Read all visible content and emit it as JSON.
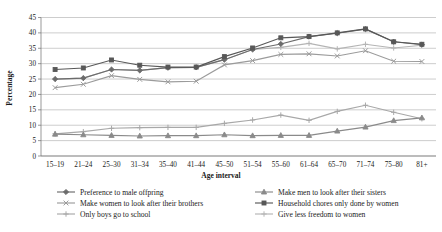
{
  "chart_data": {
    "type": "line",
    "title": "",
    "xlabel": "Age interval",
    "ylabel": "Percentage",
    "ylim": [
      0,
      45
    ],
    "yticks": [
      0,
      5,
      10,
      15,
      20,
      25,
      30,
      35,
      40,
      45
    ],
    "grid": true,
    "legend_position": "bottom",
    "categories": [
      "15–19",
      "21–24",
      "25–30",
      "31–34",
      "35–40",
      "41–44",
      "45–50",
      "51–54",
      "55–60",
      "61–64",
      "65–70",
      "71–74",
      "75–80",
      "81+"
    ],
    "series": [
      {
        "name": "Preference to male offpring",
        "marker": "diamond",
        "color": "#6b6b6b",
        "values": [
          25.0,
          25.3,
          28.1,
          27.8,
          28.7,
          28.8,
          31.3,
          34.6,
          36.4,
          38.8,
          39.9,
          41.2,
          37.1,
          36.2
        ]
      },
      {
        "name": "Make men to look after their sisters",
        "marker": "triangle",
        "color": "#8a8a8a",
        "values": [
          7.1,
          6.9,
          6.7,
          6.5,
          6.6,
          6.6,
          6.9,
          6.6,
          6.7,
          6.7,
          8.1,
          9.4,
          11.5,
          12.4
        ]
      },
      {
        "name": "Make women to look after their brothers",
        "marker": "cross",
        "color": "#9b9b9b",
        "values": [
          22.2,
          23.3,
          26.1,
          24.9,
          24.1,
          24.3,
          29.6,
          31.0,
          33.0,
          33.2,
          32.5,
          34.2,
          30.8,
          30.7
        ]
      },
      {
        "name": "Household chores only done by women",
        "marker": "square",
        "color": "#585858",
        "values": [
          28.1,
          28.6,
          31.2,
          29.5,
          28.9,
          28.9,
          32.3,
          35.1,
          38.4,
          38.8,
          40.0,
          41.3,
          37.1,
          36.3
        ]
      },
      {
        "name": "Only boys go to school",
        "marker": "plus",
        "color": "#a8a8a8",
        "values": [
          7.2,
          7.9,
          9.0,
          9.2,
          9.3,
          9.3,
          10.6,
          11.7,
          13.3,
          11.6,
          14.5,
          16.5,
          14.2,
          12.1
        ]
      },
      {
        "name": "Give less freedom to women",
        "marker": "plus-light",
        "color": "#b4b4b4",
        "values": [
          25.0,
          25.3,
          28.1,
          27.8,
          28.7,
          28.8,
          31.3,
          34.6,
          35.3,
          36.6,
          34.8,
          36.3,
          35.1,
          36.0
        ]
      }
    ]
  },
  "axes": {
    "y_title": "Percentage",
    "x_title": "Age interval"
  },
  "legend": {
    "column_left": [
      "Preference to male offpring",
      "Make women to look after their brothers",
      "Only boys go to school"
    ],
    "column_right": [
      "Make men to look after their sisters",
      "Household chores only done by women",
      "Give less freedom to women"
    ]
  }
}
